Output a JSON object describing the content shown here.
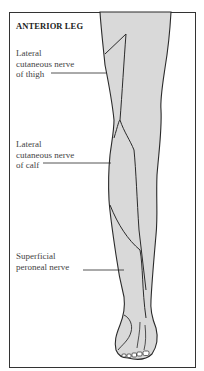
{
  "diagram": {
    "title": "ANTERIOR LEG",
    "labels": [
      {
        "line1": "Lateral",
        "line2": "cutaneous nerve",
        "line3": "of thigh"
      },
      {
        "line1": "Lateral",
        "line2": "cutaneous nerve",
        "line3": "of calf"
      },
      {
        "line1": "Superficial",
        "line2": "peroneal nerve"
      }
    ],
    "colors": {
      "skin_fill": "#d9d9d9",
      "outline": "#2a2a2a",
      "frame": "#333333",
      "background": "#ffffff"
    }
  }
}
